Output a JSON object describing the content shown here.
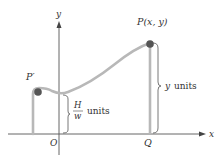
{
  "diagram": {
    "type": "hanging-cable-coordinate-diagram",
    "axes": {
      "x_label": "x",
      "y_label": "y",
      "origin_label": "O"
    },
    "points": {
      "low_point_label": "P′",
      "general_point_label": "P(x, y)",
      "foot_label": "Q"
    },
    "annotations": {
      "left_brace_numerator": "H",
      "left_brace_denominator": "w",
      "left_brace_units": "units",
      "right_brace_text": "y units"
    },
    "colors": {
      "axis": "#555555",
      "curve": "#b5b5b5",
      "dot": "#555555",
      "text": "#333333"
    }
  }
}
